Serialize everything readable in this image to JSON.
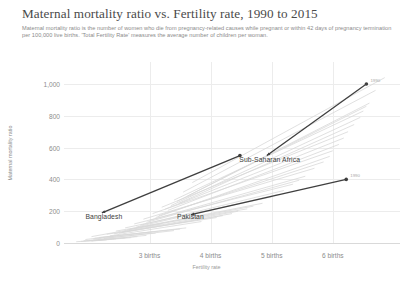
{
  "header": {
    "title": "Maternal mortality ratio vs. Fertility rate, 1990 to 2015",
    "subtitle": "Maternal mortality ratio is the number of women who die from pregnancy-related causes while pregnant or within 42 days of pregnancy termination per 100,000 live births. 'Total Fertility Rate' measures the average number of children per woman."
  },
  "chart_data": {
    "type": "line",
    "title": "Maternal mortality ratio vs. Fertility rate, 1990 to 2015",
    "subtitle": "Maternal mortality ratio is the number of women who die from pregnancy-related causes while pregnant or within 42 days of pregnancy termination per 100,000 live births. 'Total Fertility Rate' measures the average number of children per woman.",
    "xlabel": "Fertility rate",
    "ylabel": "Maternal mortality ratio",
    "xlim": [
      1.6,
      7.1
    ],
    "ylim": [
      0,
      1060
    ],
    "grid": true,
    "legend_position": "inline-labels",
    "xticks": [
      {
        "value": 3,
        "label": "3 births"
      },
      {
        "value": 4,
        "label": "4 births"
      },
      {
        "value": 5,
        "label": "5 births"
      },
      {
        "value": 6,
        "label": "6 births"
      }
    ],
    "yticks": [
      {
        "value": 0,
        "label": "0"
      },
      {
        "value": 200,
        "label": "200"
      },
      {
        "value": 400,
        "label": "400"
      },
      {
        "value": 600,
        "label": "600"
      },
      {
        "value": 800,
        "label": "800"
      },
      {
        "value": 1000,
        "label": "1,000"
      }
    ],
    "annotations": [
      {
        "text": "1990",
        "x": 6.55,
        "y": 1000
      },
      {
        "text": "1990",
        "x": 6.22,
        "y": 400
      }
    ],
    "series": [
      {
        "name": "Sub-Saharan Africa",
        "highlighted": true,
        "color": "#3f3f3f",
        "label_x": 4.47,
        "label_y": 520,
        "points": [
          {
            "x": 6.55,
            "y": 1000,
            "year": 1990
          },
          {
            "x": 4.92,
            "y": 550,
            "year": 2015
          }
        ]
      },
      {
        "name": "Pakistan",
        "highlighted": true,
        "color": "#3f3f3f",
        "label_x": 3.45,
        "label_y": 165,
        "points": [
          {
            "x": 6.22,
            "y": 400,
            "year": 1990
          },
          {
            "x": 3.68,
            "y": 178,
            "year": 2015
          }
        ]
      },
      {
        "name": "Bangladesh",
        "highlighted": true,
        "color": "#3f3f3f",
        "label_x": 1.95,
        "label_y": 165,
        "points": [
          {
            "x": 4.48,
            "y": 550,
            "year": 1990
          },
          {
            "x": 2.22,
            "y": 190,
            "year": 2015
          }
        ]
      }
    ],
    "background_series_note": "Faint grey trajectories for all other countries, mostly concentrated below 200 and fanning upward toward higher fertility rates.",
    "background_series": [
      {
        "x0": 2.05,
        "y0": 40,
        "x1": 3.2,
        "y1": 120
      },
      {
        "x0": 2.1,
        "y0": 30,
        "x1": 3.6,
        "y1": 95
      },
      {
        "x0": 1.95,
        "y0": 22,
        "x1": 3.05,
        "y1": 70
      },
      {
        "x0": 2.3,
        "y0": 55,
        "x1": 4.1,
        "y1": 160
      },
      {
        "x0": 2.45,
        "y0": 75,
        "x1": 4.6,
        "y1": 215
      },
      {
        "x0": 2.6,
        "y0": 95,
        "x1": 5.0,
        "y1": 290
      },
      {
        "x0": 2.75,
        "y0": 120,
        "x1": 5.35,
        "y1": 370
      },
      {
        "x0": 2.9,
        "y0": 150,
        "x1": 5.7,
        "y1": 470
      },
      {
        "x0": 3.05,
        "y0": 185,
        "x1": 6.0,
        "y1": 580
      },
      {
        "x0": 3.2,
        "y0": 225,
        "x1": 6.25,
        "y1": 700
      },
      {
        "x0": 3.4,
        "y0": 270,
        "x1": 6.5,
        "y1": 830
      },
      {
        "x0": 3.55,
        "y0": 320,
        "x1": 6.7,
        "y1": 960
      },
      {
        "x0": 3.7,
        "y0": 380,
        "x1": 6.85,
        "y1": 1040
      },
      {
        "x0": 2.15,
        "y0": 18,
        "x1": 2.95,
        "y1": 48
      },
      {
        "x0": 2.25,
        "y0": 28,
        "x1": 3.4,
        "y1": 78
      },
      {
        "x0": 2.05,
        "y0": 12,
        "x1": 2.7,
        "y1": 34
      },
      {
        "x0": 2.5,
        "y0": 62,
        "x1": 4.35,
        "y1": 185
      },
      {
        "x0": 2.68,
        "y0": 88,
        "x1": 4.85,
        "y1": 250
      },
      {
        "x0": 2.85,
        "y0": 112,
        "x1": 5.2,
        "y1": 330
      },
      {
        "x0": 3.0,
        "y0": 142,
        "x1": 5.55,
        "y1": 420
      },
      {
        "x0": 3.15,
        "y0": 172,
        "x1": 5.85,
        "y1": 510
      },
      {
        "x0": 3.3,
        "y0": 205,
        "x1": 6.1,
        "y1": 620
      },
      {
        "x0": 3.48,
        "y0": 250,
        "x1": 6.35,
        "y1": 745
      },
      {
        "x0": 3.62,
        "y0": 295,
        "x1": 6.6,
        "y1": 880
      },
      {
        "x0": 1.88,
        "y0": 10,
        "x1": 2.45,
        "y1": 26
      },
      {
        "x0": 2.0,
        "y0": 15,
        "x1": 2.8,
        "y1": 40
      },
      {
        "x0": 2.35,
        "y0": 45,
        "x1": 3.85,
        "y1": 135
      },
      {
        "x0": 2.55,
        "y0": 70,
        "x1": 4.45,
        "y1": 200
      },
      {
        "x0": 2.78,
        "y0": 100,
        "x1": 5.1,
        "y1": 305
      },
      {
        "x0": 3.1,
        "y0": 160,
        "x1": 5.95,
        "y1": 545
      },
      {
        "x0": 3.35,
        "y0": 235,
        "x1": 6.45,
        "y1": 790
      },
      {
        "x0": 1.8,
        "y0": 8,
        "x1": 2.3,
        "y1": 20
      },
      {
        "x0": 2.18,
        "y0": 35,
        "x1": 3.5,
        "y1": 88
      },
      {
        "x0": 2.42,
        "y0": 58,
        "x1": 4.2,
        "y1": 172
      },
      {
        "x0": 2.95,
        "y0": 130,
        "x1": 5.45,
        "y1": 395
      },
      {
        "x0": 3.25,
        "y0": 212,
        "x1": 6.18,
        "y1": 660
      },
      {
        "x0": 1.92,
        "y0": 14,
        "x1": 2.6,
        "y1": 32
      },
      {
        "x0": 2.63,
        "y0": 82,
        "x1": 4.7,
        "y1": 232
      },
      {
        "x0": 3.45,
        "y0": 262,
        "x1": 6.55,
        "y1": 860
      },
      {
        "x0": 2.08,
        "y0": 24,
        "x1": 3.1,
        "y1": 62
      }
    ]
  }
}
